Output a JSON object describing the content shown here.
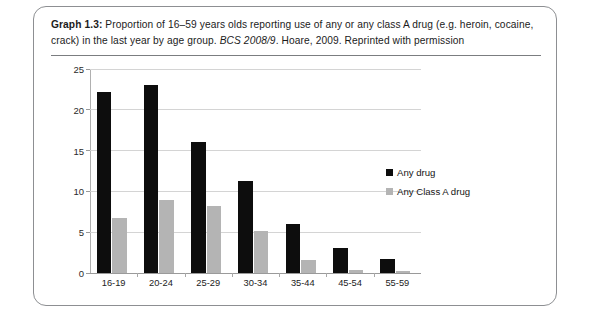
{
  "panel": {
    "caption": {
      "label": "Graph 1.3:",
      "text_before_italic": " Proportion of 16–59 years olds reporting use of any or any class A drug (e.g. heroin, cocaine, crack) in the last year by age group. ",
      "italic": "BCS 2008/9",
      "text_after_italic": ". Hoare, 2009. Reprinted with permission"
    }
  },
  "chart_data": {
    "type": "bar",
    "title": "Graph 1.3: Proportion of 16–59 years olds reporting use of any or any class A drug (e.g. heroin, cocaine, crack) in the last year by age group. BCS 2008/9. Hoare, 2009. Reprinted with permission",
    "xlabel": "",
    "ylabel": "",
    "categories": [
      "16-19",
      "20-24",
      "25-29",
      "30-34",
      "35-44",
      "45-54",
      "55-59"
    ],
    "series": [
      {
        "name": "Any drug",
        "color": "#0d0d0d",
        "values": [
          22.2,
          23.0,
          16.0,
          11.3,
          6.0,
          3.1,
          1.7
        ]
      },
      {
        "name": "Any Class A drug",
        "color": "#b4b4b4",
        "values": [
          6.7,
          9.0,
          8.2,
          5.2,
          1.6,
          0.4,
          0.2
        ]
      }
    ],
    "ylim": [
      0,
      25
    ],
    "yticks": [
      0,
      5,
      10,
      15,
      20,
      25
    ],
    "ytick_labels": [
      "0",
      "5",
      "10",
      "15",
      "20",
      "25"
    ],
    "grid": true,
    "grid_axis": "y",
    "legend_position": "center right",
    "legend": [
      "Any drug",
      "Any Class A drug"
    ]
  }
}
